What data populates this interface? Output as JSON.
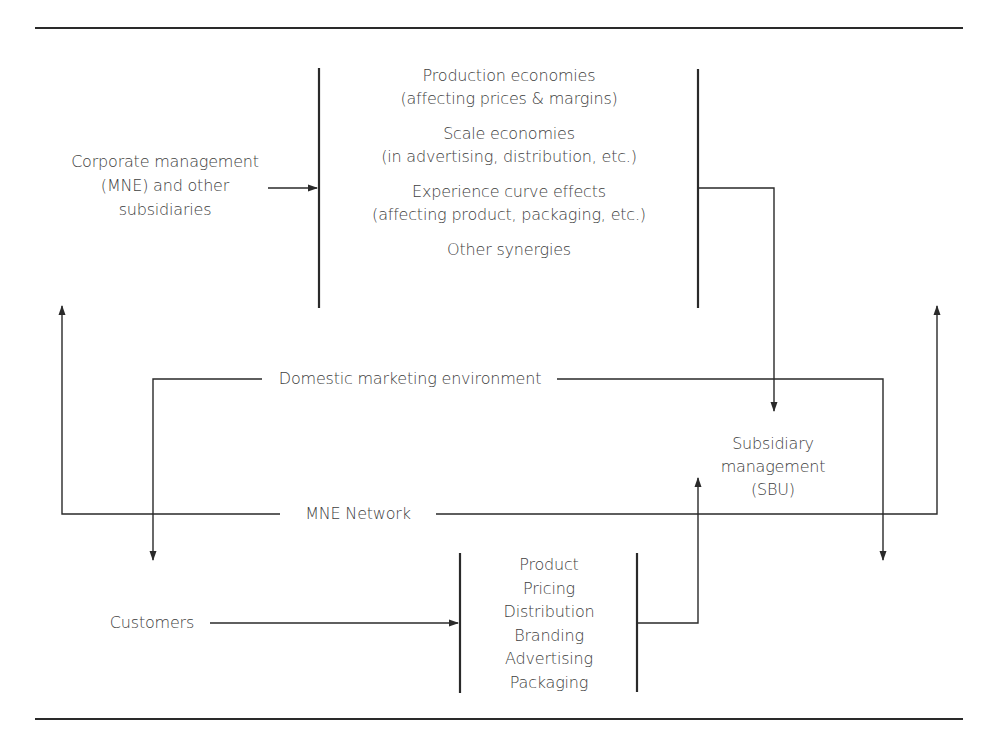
{
  "diagram": {
    "corporate": {
      "lines": [
        "Corporate management",
        "(MNE) and other",
        "subsidiaries"
      ]
    },
    "synergies": {
      "items": [
        {
          "title": "Production economies",
          "detail": "(affecting prices & margins)"
        },
        {
          "title": "Scale economies",
          "detail": "(in advertising, distribution, etc.)"
        },
        {
          "title": "Experience curve effects",
          "detail": "(affecting product, packaging, etc.)"
        },
        {
          "title": "Other synergies",
          "detail": ""
        }
      ]
    },
    "domestic_environment": "Domestic marketing environment",
    "subsidiary": {
      "lines": [
        "Subsidiary",
        "management",
        "(SBU)"
      ]
    },
    "mne_network": "MNE Network",
    "customers": "Customers",
    "marketing_mix": {
      "items": [
        "Product",
        "Pricing",
        "Distribution",
        "Branding",
        "Advertising",
        "Packaging"
      ]
    },
    "colors": {
      "line": "#2a2a2a",
      "text": "#404040",
      "background": "#ffffff"
    }
  }
}
